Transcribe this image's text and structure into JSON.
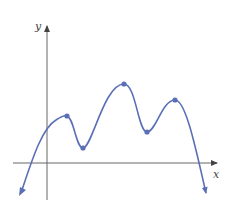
{
  "diagram": {
    "type": "function-graph",
    "axes": {
      "x_label": "x",
      "y_label": "y",
      "color": "#555555"
    },
    "curve": {
      "color": "#5b6fb6",
      "marked_points": [
        {
          "kind": "local-max",
          "px": [
            67,
            116
          ]
        },
        {
          "kind": "local-min",
          "px": [
            83,
            148
          ]
        },
        {
          "kind": "local-max",
          "px": [
            124,
            84
          ]
        },
        {
          "kind": "local-min",
          "px": [
            147,
            132
          ]
        },
        {
          "kind": "local-max",
          "px": [
            175,
            100
          ]
        }
      ]
    }
  }
}
